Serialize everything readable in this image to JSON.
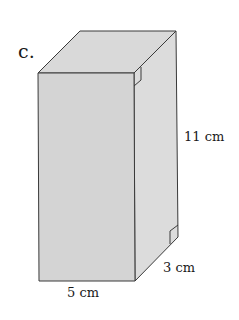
{
  "figure": {
    "part_label": "c.",
    "shape": "rectangular prism",
    "face_color": "#d6d6d6",
    "top_color": "#d9d9d9",
    "side_color": "#dcdcdc",
    "edge_color": "#3a3a3a",
    "dimensions": {
      "height": "11 cm",
      "width": "5 cm",
      "depth": "3 cm"
    },
    "right_angle_markers": 2
  }
}
